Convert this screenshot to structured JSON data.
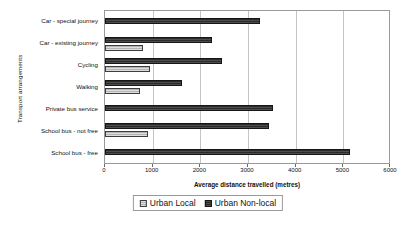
{
  "chart_data": {
    "type": "bar",
    "orientation": "horizontal",
    "title": "",
    "xlabel": "Average distance travelled (metres)",
    "ylabel": "Transport arrangements",
    "xlim": [
      0,
      6000
    ],
    "xticks": [
      0,
      1000,
      2000,
      3000,
      4000,
      5000,
      6000
    ],
    "xtick_labels": [
      "0",
      "1000",
      "2000",
      "3000",
      "4000",
      "5000",
      "6000"
    ],
    "grid": true,
    "legend_position": "bottom",
    "categories": [
      "Car - special journey",
      "Car - existing journey",
      "Cycling",
      "Walking",
      "Private bus service",
      "School bus - not free",
      "School bus - free"
    ],
    "series": [
      {
        "name": "Urban Local",
        "color": "#b4b4b4",
        "values": [
          0,
          800,
          950,
          730,
          0,
          900,
          0
        ]
      },
      {
        "name": "Urban Non-local",
        "color": "#2b2b2b",
        "values": [
          3250,
          2250,
          2450,
          1620,
          3520,
          3450,
          5150
        ]
      }
    ]
  }
}
